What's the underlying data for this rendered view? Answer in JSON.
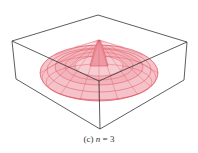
{
  "figure": {
    "caption_prefix": "(c) ",
    "caption_var": "n",
    "caption_suffix": " = 3",
    "surface_color": "#e0505e",
    "box_color": "#333333"
  }
}
